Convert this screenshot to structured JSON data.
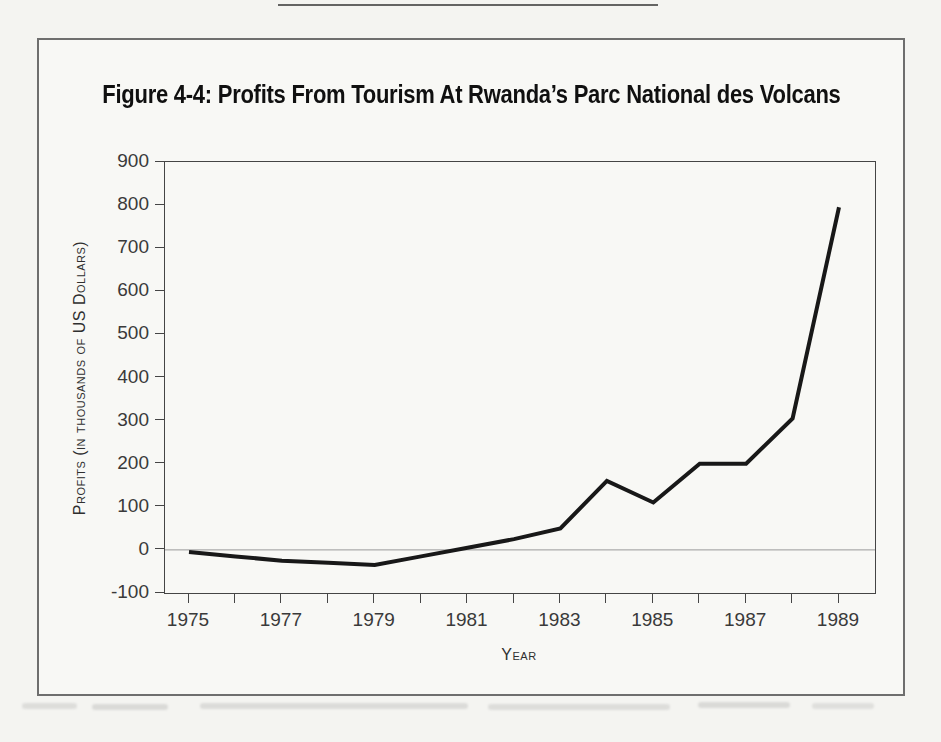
{
  "figure": {
    "title": "Figure 4-4: Profits From Tourism At Rwanda’s Parc National des Volcans"
  },
  "chart_data": {
    "type": "line",
    "title": "Figure 4-4: Profits From Tourism At Rwanda’s Parc National des Volcans",
    "xlabel": "Year",
    "ylabel": "Profits (in thousands of US Dollars)",
    "units": "thousands of US dollars",
    "x": [
      1975,
      1976,
      1977,
      1978,
      1979,
      1980,
      1981,
      1982,
      1983,
      1984,
      1985,
      1986,
      1987,
      1988,
      1989
    ],
    "values": [
      -5,
      -15,
      -25,
      -30,
      -35,
      -15,
      5,
      25,
      50,
      160,
      110,
      200,
      200,
      305,
      795
    ],
    "ylim": [
      -100,
      900
    ],
    "ytick_step": 100,
    "ytick_labels": [
      "900",
      "800",
      "700",
      "600",
      "500",
      "400",
      "300",
      "200",
      "100",
      "0",
      "-100"
    ],
    "xtick_labels": [
      "1975",
      "1977",
      "1979",
      "1981",
      "1983",
      "1985",
      "1987",
      "1989"
    ],
    "grid": "horizontal zero-line only",
    "legend": "none",
    "series_name": "Profits from tourism"
  },
  "colors": {
    "line": "#181818",
    "paper": "#f4f4f1",
    "figure_background": "#f8f8f5",
    "axis": "#454545",
    "zero_line": "#999999",
    "box_border": "#6e6e6e"
  }
}
